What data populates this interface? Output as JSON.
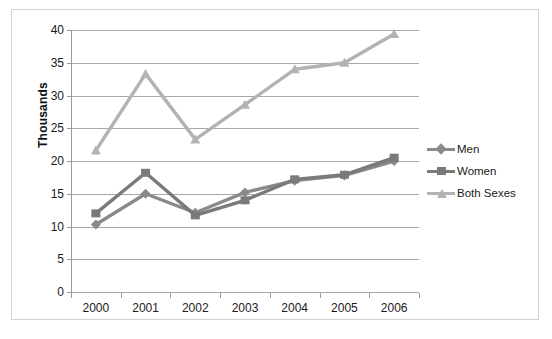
{
  "chart_data": {
    "type": "line",
    "title": "",
    "xlabel": "",
    "ylabel": "Thousands",
    "categories": [
      "2000",
      "2001",
      "2002",
      "2003",
      "2004",
      "2005",
      "2006"
    ],
    "x": [
      2000,
      2001,
      2002,
      2003,
      2004,
      2005,
      2006
    ],
    "ylim": [
      0,
      40
    ],
    "yticks": [
      0,
      5,
      10,
      15,
      20,
      25,
      30,
      35,
      40
    ],
    "ytick_labels": [
      "0",
      "5",
      "10",
      "15",
      "20",
      "25",
      "30",
      "35",
      "40"
    ],
    "grid": true,
    "legend_position": "right",
    "series": [
      {
        "name": "Men",
        "color": "#8a8a8a",
        "marker": "diamond",
        "values": [
          10.3,
          15.0,
          12.1,
          15.2,
          17.0,
          17.8,
          20.0
        ]
      },
      {
        "name": "Women",
        "color": "#7a7a7a",
        "marker": "square",
        "values": [
          12.0,
          18.2,
          11.7,
          14.0,
          17.2,
          17.9,
          20.5
        ]
      },
      {
        "name": "Both Sexes",
        "color": "#b3b3b3",
        "marker": "triangle",
        "values": [
          21.6,
          33.3,
          23.3,
          28.6,
          34.0,
          35.0,
          39.4
        ]
      }
    ]
  },
  "axis": {
    "y_title": "Thousands"
  },
  "legend": {
    "items": [
      {
        "label": "Men"
      },
      {
        "label": "Women"
      },
      {
        "label": "Both Sexes"
      }
    ]
  },
  "top_crop": {
    "fragment_1": " ",
    "fragment_2": " ",
    "fragment_3": " "
  },
  "colors": {
    "series_men": "#8a8a8a",
    "series_women": "#7a7a7a",
    "series_both": "#b3b3b3",
    "gridline": "#a8a8a8",
    "axis": "#9a9a9a",
    "frame": "#d2d2d2",
    "text": "#1a1a1a",
    "background": "#ffffff"
  }
}
